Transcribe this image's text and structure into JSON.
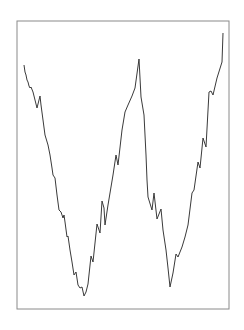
{
  "chart_data": {
    "type": "line",
    "title": "",
    "xlabel": "",
    "ylabel": "",
    "grid": false,
    "legend": null,
    "axes_visible": false,
    "frame": {
      "x": 17,
      "y": 21,
      "width": 212,
      "height": 288,
      "stroke": "#8a8a8a"
    },
    "series": [
      {
        "name": "series-1",
        "color": "#3a3a3a",
        "pixel_points": [
          [
            24,
            65
          ],
          [
            25,
            72
          ],
          [
            26,
            75
          ],
          [
            27,
            80
          ],
          [
            28,
            82
          ],
          [
            29,
            86
          ],
          [
            30,
            88
          ],
          [
            31,
            87
          ],
          [
            33,
            92
          ],
          [
            35,
            100
          ],
          [
            37,
            108
          ],
          [
            40,
            96
          ],
          [
            41,
            105
          ],
          [
            43,
            120
          ],
          [
            45,
            135
          ],
          [
            48,
            145
          ],
          [
            50,
            155
          ],
          [
            52,
            168
          ],
          [
            53,
            175
          ],
          [
            55,
            178
          ],
          [
            57,
            195
          ],
          [
            59,
            210
          ],
          [
            61,
            212
          ],
          [
            63,
            218
          ],
          [
            64,
            215
          ],
          [
            65,
            222
          ],
          [
            67,
            237
          ],
          [
            68,
            236
          ],
          [
            70,
            250
          ],
          [
            72,
            262
          ],
          [
            74,
            275
          ],
          [
            76,
            272
          ],
          [
            78,
            285
          ],
          [
            80,
            288
          ],
          [
            82,
            287
          ],
          [
            84,
            296
          ],
          [
            86,
            292
          ],
          [
            88,
            284
          ],
          [
            91,
            256
          ],
          [
            93,
            262
          ],
          [
            97,
            224
          ],
          [
            100,
            233
          ],
          [
            102,
            201
          ],
          [
            104,
            208
          ],
          [
            105,
            225
          ],
          [
            108,
            205
          ],
          [
            113,
            175
          ],
          [
            116,
            155
          ],
          [
            118,
            165
          ],
          [
            122,
            130
          ],
          [
            125,
            112
          ],
          [
            128,
            105
          ],
          [
            132,
            96
          ],
          [
            135,
            88
          ],
          [
            139,
            59
          ],
          [
            141,
            97
          ],
          [
            144,
            115
          ],
          [
            146,
            155
          ],
          [
            147,
            180
          ],
          [
            148,
            197
          ],
          [
            152,
            210
          ],
          [
            154,
            193
          ],
          [
            157,
            219
          ],
          [
            161,
            209
          ],
          [
            163,
            230
          ],
          [
            166,
            250
          ],
          [
            168,
            268
          ],
          [
            170,
            287
          ],
          [
            173,
            273
          ],
          [
            176,
            254
          ],
          [
            178,
            257
          ],
          [
            182,
            247
          ],
          [
            185,
            237
          ],
          [
            188,
            225
          ],
          [
            192,
            193
          ],
          [
            194,
            190
          ],
          [
            196,
            176
          ],
          [
            198,
            162
          ],
          [
            200,
            168
          ],
          [
            203,
            138
          ],
          [
            206,
            147
          ],
          [
            209,
            92
          ],
          [
            211,
            91
          ],
          [
            213,
            95
          ],
          [
            217,
            78
          ],
          [
            222,
            62
          ],
          [
            223,
            33
          ]
        ]
      }
    ]
  }
}
